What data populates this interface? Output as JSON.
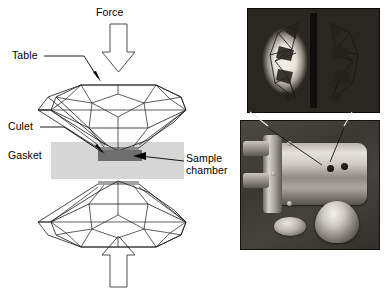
{
  "figure": {
    "type": "diamond-anvil-cell-schematic-with-photographs",
    "background_color": "#ffffff"
  },
  "schematic": {
    "labels": {
      "force": "Force",
      "table": "Table",
      "culet": "Culet",
      "gasket": "Gasket",
      "sample_chamber_line1": "Sample",
      "sample_chamber_line2": "chamber"
    },
    "colors": {
      "gasket_fill": "#d6d6d6",
      "sample_chamber_fill": "#6e6e6e",
      "outline": "#1a1a1a",
      "arrow_fill": "#ffffff",
      "arrow_stroke": "#3a3a3a"
    },
    "arrows": {
      "top_direction": "down",
      "bottom_direction": "up",
      "top_label": "Force",
      "bottom_label": ""
    },
    "components": [
      "upper diamond anvil",
      "lower diamond anvil",
      "gasket",
      "sample chamber",
      "table facet",
      "culet"
    ]
  },
  "photos": {
    "top": {
      "caption": "",
      "description": "microscope view of two opposed diamond anvil culets",
      "background_color": "#14110f"
    },
    "bottom": {
      "caption": "",
      "description": "diamond anvil cell body with anvil and coin for scale",
      "background_color": "#3b3833"
    }
  }
}
